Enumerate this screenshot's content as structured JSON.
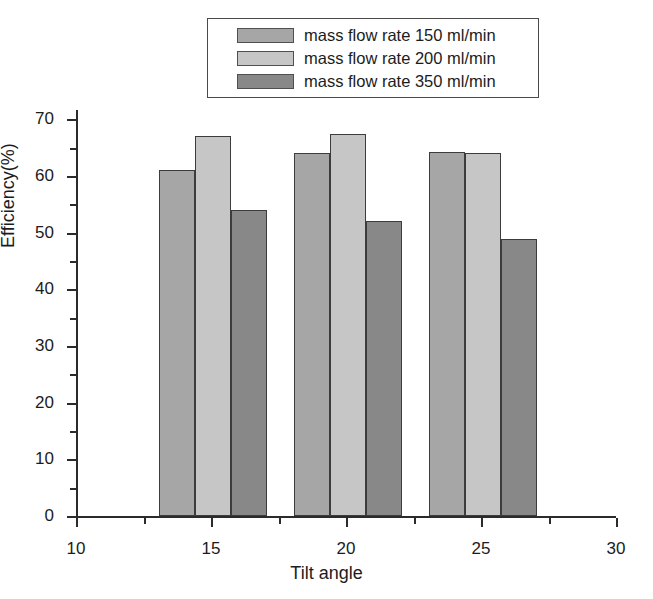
{
  "chart_data": {
    "type": "bar",
    "title": "",
    "xlabel": "Tilt angle",
    "ylabel": "Efficiency(%)",
    "xlim": [
      10,
      30
    ],
    "ylim": [
      0,
      72
    ],
    "categories": [
      15,
      20,
      25
    ],
    "x_tick_labels": [
      "10",
      "15",
      "20",
      "25",
      "30"
    ],
    "x_tick_values": [
      10,
      15,
      20,
      25,
      30
    ],
    "y_tick_labels": [
      "0",
      "10",
      "20",
      "30",
      "40",
      "50",
      "60",
      "70"
    ],
    "y_tick_values": [
      0,
      10,
      20,
      30,
      40,
      50,
      60,
      70
    ],
    "y_minor_tick_values": [
      5,
      15,
      25,
      35,
      45,
      55,
      65
    ],
    "grid": false,
    "legend_position": "top-center",
    "series": [
      {
        "name": "mass flow rate 150 ml/min",
        "color": "#a6a6a6",
        "values": [
          61,
          64,
          64.2
        ]
      },
      {
        "name": "mass flow rate 200 ml/min",
        "color": "#c6c6c6",
        "values": [
          67,
          67.4,
          64
        ]
      },
      {
        "name": "mass flow rate 350 ml/min",
        "color": "#888888",
        "values": [
          54,
          52,
          48.8
        ]
      }
    ]
  },
  "legend": {
    "items": [
      {
        "label": "mass flow rate 150 ml/min",
        "color": "#a6a6a6"
      },
      {
        "label": "mass flow rate 200 ml/min",
        "color": "#c6c6c6"
      },
      {
        "label": "mass flow rate 350 ml/min",
        "color": "#888888"
      }
    ]
  },
  "axes": {
    "x_title": "Tilt angle",
    "y_title": "Efficiency(%)"
  }
}
